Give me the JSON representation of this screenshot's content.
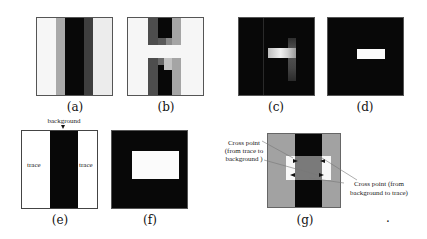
{
  "figure": {
    "panels": [
      {
        "id": "a",
        "caption": "(a)"
      },
      {
        "id": "b",
        "caption": "(b)"
      },
      {
        "id": "c",
        "caption": "(c)"
      },
      {
        "id": "d",
        "caption": "(d)"
      },
      {
        "id": "e",
        "caption": "(e)",
        "labels": {
          "top": "background",
          "left": "trace",
          "right": "trace"
        }
      },
      {
        "id": "f",
        "caption": "(f)"
      },
      {
        "id": "g",
        "caption": "(g)",
        "annotations": {
          "left_line1": "Cross point",
          "left_line2": "(from trace to",
          "left_line3": "background   )",
          "right_line1": "Cross point (from",
          "right_line2": "background to trace)"
        }
      }
    ],
    "trailing_mark": "."
  },
  "colors": {
    "black": "#080808",
    "dark_gray": "#4a4a4a",
    "mid_gray": "#7a7a7a",
    "light_gray": "#a8a8a8",
    "white": "#f8f8f8"
  }
}
